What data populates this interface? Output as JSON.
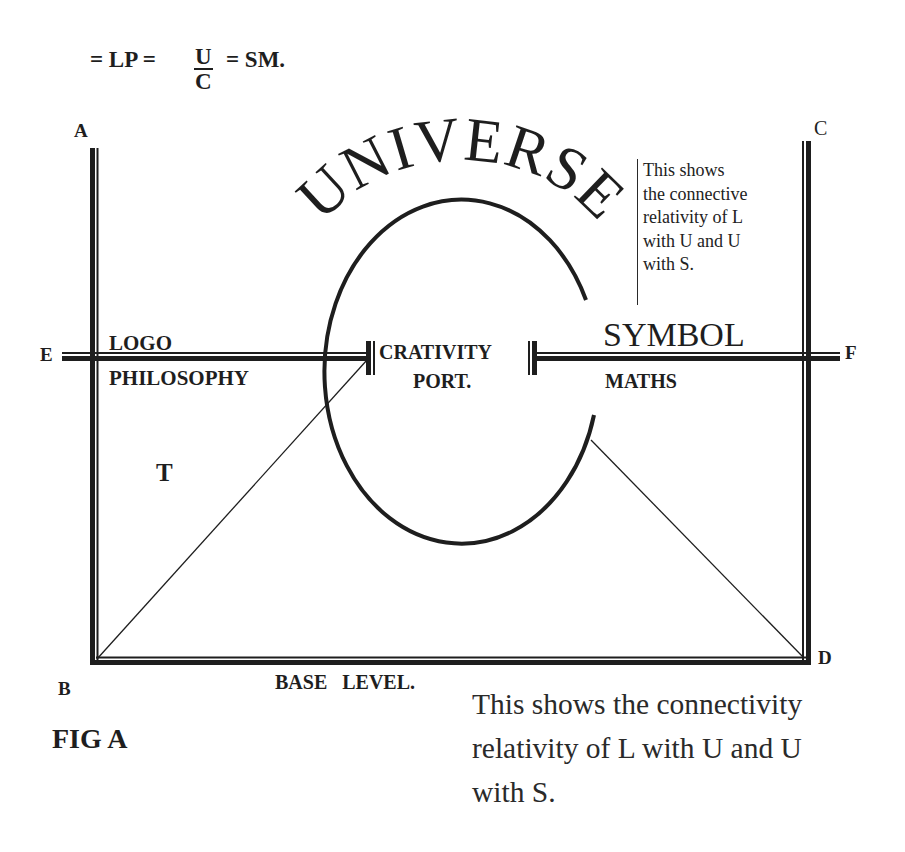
{
  "formula": {
    "prefix": "= LP =",
    "numerator": "U",
    "denominator": "C",
    "suffix": "= SM."
  },
  "points": {
    "A": "A",
    "B": "B",
    "C": "C",
    "D": "D",
    "E": "E",
    "F": "F"
  },
  "arc_title": "UNIVERSE",
  "left_block": {
    "line1": "LOGO",
    "line2": "PHILOSOPHY"
  },
  "center_block": {
    "line1": "CRATIVITY",
    "line2": "PORT."
  },
  "right_block": {
    "line1": "SYMBOL",
    "line2": "MATHS"
  },
  "region_label": "T",
  "base_label": "BASE   LEVEL.",
  "side_note": {
    "lines": [
      "This shows",
      "the connective",
      "relativity of L",
      "with U and U",
      "with S."
    ]
  },
  "figure_label": "FIG A",
  "caption": {
    "lines": [
      "This shows the connectivity",
      "relativity of L with U and U",
      "with S."
    ]
  },
  "colors": {
    "ink": "#1e1e1e",
    "background": "#ffffff"
  }
}
